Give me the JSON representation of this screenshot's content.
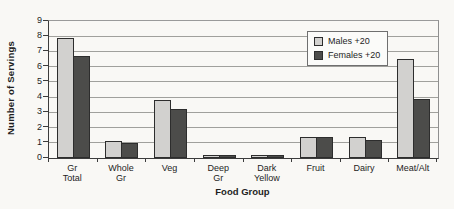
{
  "chart_data": {
    "type": "bar",
    "title": "",
    "xlabel": "Food Group",
    "ylabel": "Number of Servings",
    "ylim": [
      0,
      9
    ],
    "ytick_interval": 1,
    "yticks": [
      0,
      1,
      2,
      3,
      4,
      5,
      6,
      7,
      8,
      9
    ],
    "grid": true,
    "legend_position": "upper-right-inside",
    "categories": [
      "Gr\nTotal",
      "Whole\nGr",
      "Veg",
      "Deep\nGr",
      "Dark\nYellow",
      "Fruit",
      "Dairy",
      "Meat/Alt"
    ],
    "series": [
      {
        "name": "Males +20",
        "color": "#d2d1cf",
        "values": [
          7.9,
          1.1,
          3.8,
          0.2,
          0.2,
          1.4,
          1.4,
          6.5
        ]
      },
      {
        "name": "Females +20",
        "color": "#4c4c4a",
        "values": [
          6.7,
          1.0,
          3.2,
          0.2,
          0.2,
          1.4,
          1.2,
          3.9
        ]
      }
    ]
  },
  "colors": {
    "background": "#f9f8f5",
    "gridline": "#a0a09c",
    "axis": "#3c3c3c",
    "bar_outline": "#2d2d2d"
  }
}
